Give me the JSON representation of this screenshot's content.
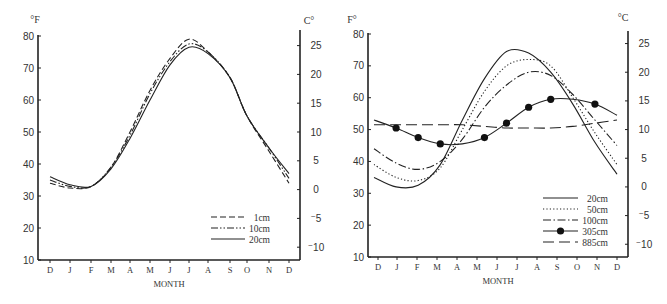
{
  "chart_data": [
    {
      "type": "line",
      "title": "",
      "xlabel": "MONTH",
      "ylabel_left": "°F",
      "ylabel_right": "C°",
      "categories": [
        "D",
        "J",
        "F",
        "M",
        "A",
        "M",
        "J",
        "J",
        "A",
        "S",
        "O",
        "N",
        "D"
      ],
      "ylim_f": [
        10,
        80
      ],
      "yticks_f": [
        10,
        20,
        30,
        40,
        50,
        60,
        70,
        80
      ],
      "yticks_c": [
        25,
        20,
        15,
        10,
        5,
        0,
        -5,
        -10
      ],
      "grid": false,
      "legend_position": "lower right",
      "series": [
        {
          "name": "1cm",
          "style": "dashed",
          "values": [
            34,
            32.5,
            33,
            39,
            50,
            63,
            73,
            79,
            75,
            67,
            55,
            44,
            34
          ]
        },
        {
          "name": "10cm",
          "style": "dash-dot-dot",
          "values": [
            35,
            33,
            33,
            39,
            49,
            62,
            72,
            77.5,
            75,
            67,
            55,
            45,
            35.5
          ]
        },
        {
          "name": "20cm",
          "style": "solid",
          "values": [
            36,
            33.5,
            33,
            38.5,
            48,
            60,
            71,
            76.5,
            74.5,
            67,
            55,
            45,
            37
          ]
        }
      ]
    },
    {
      "type": "line",
      "title": "",
      "xlabel": "MONTH",
      "ylabel_left": "F°",
      "ylabel_right": "°C",
      "categories": [
        "D",
        "J",
        "F",
        "M",
        "A",
        "M",
        "J",
        "J",
        "A",
        "S",
        "O",
        "N",
        "D"
      ],
      "ylim_f": [
        10,
        80
      ],
      "yticks_f": [
        10,
        20,
        30,
        40,
        50,
        60,
        70,
        80
      ],
      "yticks_c": [
        25,
        20,
        15,
        10,
        5,
        0,
        -5,
        -10
      ],
      "grid": false,
      "legend_position": "lower right",
      "series": [
        {
          "name": "20cm",
          "style": "solid",
          "values": [
            35,
            32,
            32.5,
            39,
            53,
            66,
            74.5,
            74,
            68,
            58,
            46,
            36
          ]
        },
        {
          "name": "50cm",
          "style": "dotted",
          "values": [
            39,
            35,
            34,
            38,
            50,
            62,
            70,
            72,
            70,
            60,
            49,
            39
          ]
        },
        {
          "name": "100cm",
          "style": "dash-dot",
          "values": [
            44,
            39.5,
            37.5,
            40,
            47,
            57,
            64,
            68,
            67,
            61,
            53,
            45
          ]
        },
        {
          "name": "305cm",
          "style": "solid-markers",
          "values": [
            53,
            50.5,
            47.5,
            45.5,
            45.5,
            47.5,
            52,
            57,
            59.5,
            59.5,
            58,
            54.5
          ]
        },
        {
          "name": "885cm",
          "style": "long-dash",
          "values": [
            51.5,
            51.5,
            51.5,
            51.5,
            51.5,
            51,
            50.5,
            50.5,
            50.5,
            51,
            52,
            53
          ]
        }
      ]
    }
  ],
  "left_chart": {
    "unit_left": "°F",
    "unit_right": "C°",
    "x_title": "MONTH",
    "legend": [
      "1cm",
      "10cm",
      "20cm"
    ]
  },
  "right_chart": {
    "unit_left": "F°",
    "unit_right": "°C",
    "x_title": "MONTH",
    "legend": [
      "20cm",
      "50cm",
      "100cm",
      "305cm",
      "885cm"
    ]
  }
}
